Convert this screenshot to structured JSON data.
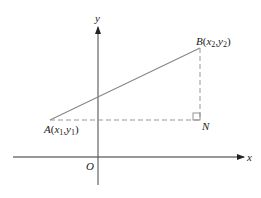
{
  "diagram": {
    "type": "coordinate-geometry",
    "axes": {
      "x_label": "x",
      "y_label": "y",
      "origin_label": "O"
    },
    "points": {
      "A": {
        "name": "A",
        "x_sub": "1",
        "y_sub": "1",
        "open": "(",
        "comma": ",",
        "close": ")",
        "x_var": "x",
        "y_var": "y"
      },
      "B": {
        "name": "B",
        "x_sub": "2",
        "y_sub": "2",
        "open": "(",
        "comma": ",",
        "close": ")",
        "x_var": "x",
        "y_var": "y"
      },
      "N": {
        "name": "N"
      }
    },
    "colors": {
      "axis": "#333333",
      "segment": "#888888",
      "dashed": "#999999",
      "text": "#222222"
    }
  }
}
